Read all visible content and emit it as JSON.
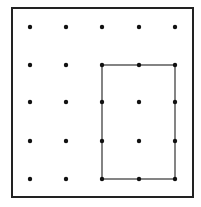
{
  "diagram": {
    "type": "geoboard",
    "frame": {
      "x": 12,
      "y": 8,
      "width": 181,
      "height": 189,
      "stroke": "#222222"
    },
    "grid": {
      "columns_x": [
        30,
        66,
        102,
        139,
        175
      ],
      "rows_y": [
        27,
        65,
        102,
        141,
        179
      ],
      "dot_color": "#111111",
      "dot_radius": 2.2
    },
    "rectangle": {
      "from": {
        "col": 2,
        "row": 1
      },
      "to": {
        "col": 4,
        "row": 4
      },
      "stroke": "#333333",
      "label": "3 by 4 dot rectangle"
    }
  }
}
